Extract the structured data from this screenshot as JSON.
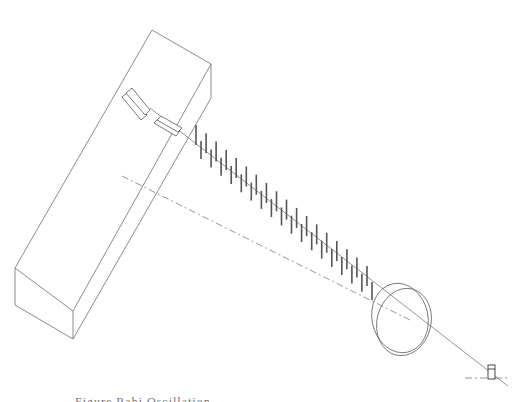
{
  "figure": {
    "colors": {
      "background": "#ffffff",
      "lines": "#6e6e6e",
      "rods": "#555555"
    },
    "components": [
      "large-rectangular-box",
      "mirror-plates",
      "magnet-rod-array",
      "beam-line",
      "dashed-axis-line",
      "ring-pair",
      "small-target"
    ]
  },
  "caption": {
    "text": "Figure  Rabi Oscillation",
    "visible": "partially cut off at bottom edge"
  }
}
